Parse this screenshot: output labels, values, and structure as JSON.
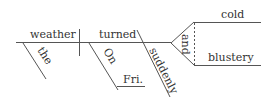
{
  "diagram": {
    "type": "sentence-diagram",
    "sentence": "The weather turned suddenly cold and blustery on Fri.",
    "subject": "weather",
    "verb": "turned",
    "subject_modifiers": [
      "the"
    ],
    "verb_modifiers": [
      "suddenly"
    ],
    "prepositional_phrase": {
      "preposition": "On",
      "object": "Fri."
    },
    "conjunction": "and",
    "compound_complement": [
      "cold",
      "blustery"
    ],
    "colors": {
      "line": "#555555",
      "text": "#333333",
      "background": "#ffffff"
    }
  }
}
